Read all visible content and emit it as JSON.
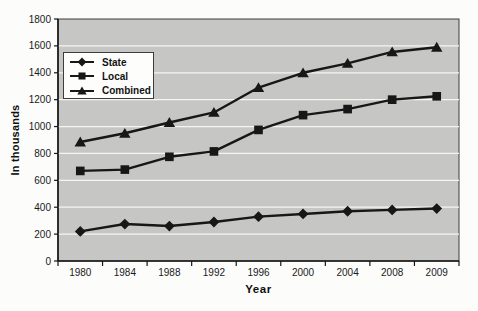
{
  "figure": {
    "background": "#fcfcfa",
    "plot_bg": "#c6c6c4",
    "grid_color": "#f5f5f2",
    "line_color": "#171717",
    "axis_color": "#161616",
    "border_color": "#3c3c3c"
  },
  "chart_data": {
    "type": "line",
    "title": "",
    "xlabel": "Year",
    "ylabel": "In thousands",
    "categories": [
      "1980",
      "1984",
      "1988",
      "1992",
      "1996",
      "2000",
      "2004",
      "2008",
      "2009"
    ],
    "series": [
      {
        "name": "State",
        "marker": "diamond",
        "values": [
          220,
          275,
          260,
          290,
          330,
          350,
          370,
          380,
          390
        ]
      },
      {
        "name": "Local",
        "marker": "square",
        "values": [
          670,
          680,
          775,
          815,
          975,
          1085,
          1130,
          1200,
          1225
        ]
      },
      {
        "name": "Combined",
        "marker": "triangle",
        "values": [
          885,
          950,
          1030,
          1105,
          1290,
          1400,
          1470,
          1555,
          1590
        ]
      }
    ],
    "ylim": [
      0,
      1800
    ],
    "yticks": [
      0,
      200,
      400,
      600,
      800,
      1000,
      1200,
      1400,
      1600,
      1800
    ],
    "grid": "horizontal",
    "legend_position": "top-left-inside"
  }
}
